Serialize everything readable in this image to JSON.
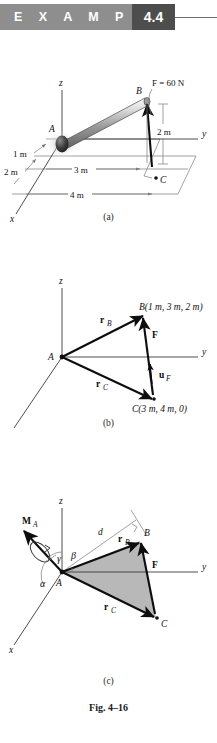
{
  "header": {
    "label": "E X A M P L E",
    "number": "4.4"
  },
  "figure": {
    "caption": "Fig. 4–16",
    "sub_a": "(a)",
    "sub_b": "(b)",
    "sub_c": "(c)"
  },
  "fig_a": {
    "axis_x": "x",
    "axis_y": "y",
    "axis_z": "z",
    "point_a": "A",
    "point_b": "B",
    "point_c": "C",
    "force": "F = 60 N",
    "dim_1m": "1 m",
    "dim_2m_x": "2 m",
    "dim_3m": "3 m",
    "dim_4m": "4 m",
    "dim_2m_z": "2 m"
  },
  "fig_b": {
    "axis_x": "x",
    "axis_y": "y",
    "axis_z": "z",
    "point_a": "A",
    "point_b": "B(1 m, 3 m, 2 m)",
    "point_c": "C(3 m, 4 m, 0)",
    "vec_rb": "r",
    "vec_rb_sub": "B",
    "vec_rc": "r",
    "vec_rc_sub": "C",
    "vec_f": "F",
    "vec_uf": "u",
    "vec_uf_sub": "F"
  },
  "fig_c": {
    "axis_x": "x",
    "axis_y": "y",
    "axis_z": "z",
    "point_a": "A",
    "point_b": "B",
    "point_c": "C",
    "moment": "M",
    "moment_sub": "A",
    "angle_alpha": "α",
    "angle_beta": "β",
    "angle_gamma": "γ",
    "dist_d": "d",
    "vec_rb": "r",
    "vec_rb_sub": "B",
    "vec_rc": "r",
    "vec_rc_sub": "C",
    "vec_f": "F"
  },
  "colors": {
    "band": "#8e8e8e",
    "numbox": "#4d4d4d",
    "triangle_fill": "#b8b8b8",
    "rod_light": "#e8e8e8",
    "rod_dark": "#6a6a6a",
    "ink": "#0d0d0d"
  }
}
